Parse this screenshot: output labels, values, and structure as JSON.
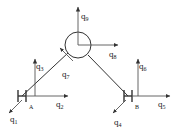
{
  "figure": {
    "type": "structural-frame-dof-diagram",
    "stroke_color": "#333333",
    "label_color": "#1a1a1a",
    "background": "#ffffff",
    "width": 175,
    "height": 134
  },
  "nodes": [
    {
      "id": "A",
      "label": "H",
      "subscript": "A",
      "x": 22,
      "y": 96
    },
    {
      "id": "B",
      "label": "H",
      "subscript": "B",
      "x": 128,
      "y": 96
    },
    {
      "id": "J",
      "label": "",
      "subscript": "",
      "x": 78,
      "y": 45,
      "shape": "circle",
      "radius": 13
    }
  ],
  "members": [
    {
      "name": "member-A-joint",
      "from": "A",
      "to": "J"
    },
    {
      "name": "member-joint-B",
      "from": "J",
      "to": "B"
    }
  ],
  "dof_arrows": [
    {
      "id": "q1",
      "label": "q",
      "subscript": "1",
      "at_node": "A",
      "direction": "down-left",
      "label_x": 10,
      "label_y": 115
    },
    {
      "id": "q2",
      "label": "q",
      "subscript": "2",
      "at_node": "A",
      "direction": "right",
      "label_x": 56,
      "label_y": 100
    },
    {
      "id": "q3",
      "label": "q",
      "subscript": "3",
      "at_node": "A",
      "direction": "up",
      "label_x": 36,
      "label_y": 62
    },
    {
      "id": "q4",
      "label": "q",
      "subscript": "4",
      "at_node": "B",
      "direction": "down-left",
      "label_x": 114,
      "label_y": 118
    },
    {
      "id": "q5",
      "label": "q",
      "subscript": "5",
      "at_node": "B",
      "direction": "right",
      "label_x": 158,
      "label_y": 100
    },
    {
      "id": "q6",
      "label": "q",
      "subscript": "6",
      "at_node": "B",
      "direction": "up",
      "label_x": 139,
      "label_y": 62
    },
    {
      "id": "q7",
      "label": "q",
      "subscript": "7",
      "at_node": "J",
      "direction": "up-left",
      "label_x": 62,
      "label_y": 70
    },
    {
      "id": "q8",
      "label": "q",
      "subscript": "8",
      "at_node": "J",
      "direction": "right",
      "label_x": 109,
      "label_y": 50
    },
    {
      "id": "q9",
      "label": "q",
      "subscript": "9",
      "at_node": "J",
      "direction": "up",
      "label_x": 81,
      "label_y": 12
    }
  ]
}
